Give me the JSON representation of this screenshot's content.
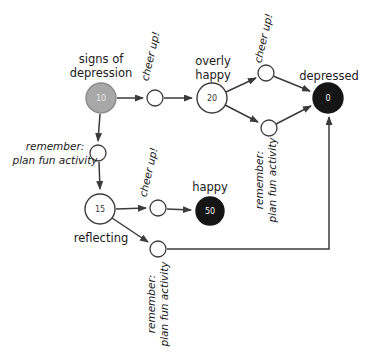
{
  "diagram": {
    "type": "mood-state-transition-diagram",
    "nodes": {
      "signs_of_depression": {
        "name_line1": "signs of",
        "name_line2": "depression",
        "value": "10"
      },
      "overly_happy": {
        "name_line1": "overly",
        "name_line2": "happy",
        "value": "20"
      },
      "depressed": {
        "name": "depressed",
        "value": "0"
      },
      "reflecting": {
        "name": "reflecting",
        "value": "15"
      },
      "happy": {
        "name": "happy",
        "value": "50"
      }
    },
    "edge_labels": {
      "cheer_up_top_left": "cheer up!",
      "cheer_up_top_right": "cheer up!",
      "cheer_up_bottom": "cheer up!",
      "remember_left": {
        "line1": "remember:",
        "line2": "plan fun activity"
      },
      "remember_middle": {
        "line1": "remember:",
        "line2": "plan fun activity"
      },
      "remember_bottom": {
        "line1": "remember:",
        "line2": "plan fun activity"
      }
    },
    "colors": {
      "node_gray_fill": "#a8a8a8",
      "node_gray_stroke": "#8a8a8a",
      "node_black_fill": "#151515",
      "node_white_fill": "#ffffff",
      "edge_stroke": "#3b3b3b",
      "text": "#1a1a1a"
    }
  }
}
